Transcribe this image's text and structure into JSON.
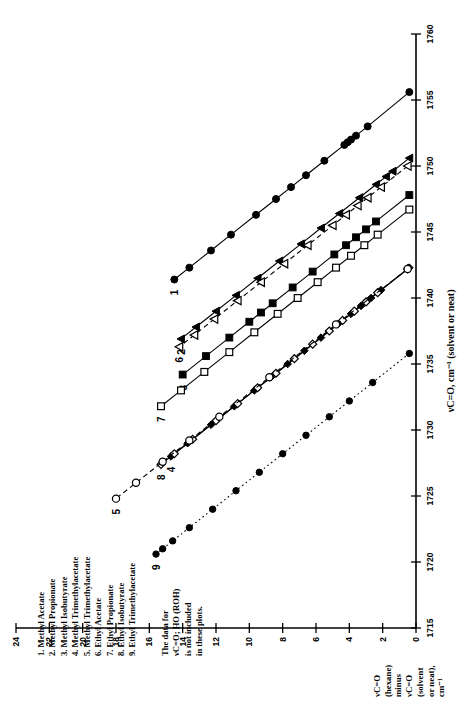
{
  "figure": {
    "legend_items": [
      "1. Methyl Acetate",
      "2. Methyl Propionate",
      "3. Methyl Isobutyrate",
      "4. Methyl Trimethylacetate",
      "5. Methyl Trimethylacetate",
      "6. Ethyl Acetate",
      "7. Ethyl Propionate",
      "8. Ethyl Isobutyrate",
      "9. Ethyl Trimethylacetate"
    ],
    "note_lines": [
      "The data for",
      "νC=O; HO (ROH)",
      "is not included",
      "in these plots."
    ],
    "ylabel_lines": [
      "νC=O",
      "(hexane)",
      "minus",
      "νC=O",
      "(solvent",
      "or neat),",
      "cm⁻¹"
    ],
    "xlabel": "νC=O, cm⁻¹ (solvent or neat)"
  },
  "chart_data": {
    "type": "scatter",
    "title": "",
    "xlabel": "νC=O, cm⁻¹ (solvent or neat)",
    "ylabel": "νC=O (hexane) minus νC=O (solvent or neat), cm⁻¹",
    "xlim": [
      1715,
      1760
    ],
    "ylim": [
      0,
      24
    ],
    "xticks": [
      1715,
      1720,
      1725,
      1730,
      1735,
      1740,
      1745,
      1750,
      1755,
      1760
    ],
    "yticks": [
      0,
      2,
      4,
      6,
      8,
      10,
      12,
      14,
      16,
      18,
      20,
      22,
      24
    ],
    "grid": false,
    "legend_position": "upper-left",
    "series": [
      {
        "name": "1. Methyl Acetate",
        "label": "1",
        "marker": "filled-circle",
        "line": "solid",
        "points": [
          [
            1755.6,
            0.4
          ],
          [
            1753.0,
            2.9
          ],
          [
            1752.3,
            3.6
          ],
          [
            1752.0,
            3.9
          ],
          [
            1751.8,
            4.1
          ],
          [
            1751.6,
            4.3
          ],
          [
            1750.4,
            5.5
          ],
          [
            1749.3,
            6.6
          ],
          [
            1748.4,
            7.5
          ],
          [
            1747.5,
            8.4
          ],
          [
            1746.3,
            9.6
          ],
          [
            1744.8,
            11.1
          ],
          [
            1743.6,
            12.3
          ],
          [
            1742.3,
            13.6
          ],
          [
            1741.4,
            14.5
          ]
        ]
      },
      {
        "name": "2. Methyl Propionate",
        "label": "2",
        "marker": "filled-triangle",
        "line": "solid",
        "points": [
          [
            1750.6,
            0.4
          ],
          [
            1749.6,
            1.4
          ],
          [
            1749.2,
            1.8
          ],
          [
            1748.6,
            2.4
          ],
          [
            1747.6,
            3.4
          ],
          [
            1746.4,
            4.6
          ],
          [
            1745.3,
            5.7
          ],
          [
            1744.1,
            6.9
          ],
          [
            1742.8,
            8.2
          ],
          [
            1741.5,
            9.5
          ],
          [
            1740.2,
            10.8
          ],
          [
            1739.0,
            12.0
          ],
          [
            1737.8,
            13.2
          ],
          [
            1736.9,
            14.1
          ]
        ]
      },
      {
        "name": "6. Ethyl Acetate",
        "label": "6",
        "marker": "open-triangle",
        "line": "dashed",
        "points": [
          [
            1750.0,
            0.5
          ],
          [
            1748.4,
            2.1
          ],
          [
            1747.6,
            2.9
          ],
          [
            1747.0,
            3.5
          ],
          [
            1746.3,
            4.2
          ],
          [
            1745.5,
            5.0
          ],
          [
            1744.0,
            6.5
          ],
          [
            1742.6,
            7.9
          ],
          [
            1741.2,
            9.3
          ],
          [
            1739.8,
            10.7
          ],
          [
            1738.4,
            12.1
          ],
          [
            1737.2,
            13.3
          ],
          [
            1736.3,
            14.2
          ]
        ]
      },
      {
        "name": "3. Methyl Isobutyrate",
        "label": "3",
        "marker": "filled-square",
        "line": "solid",
        "points": [
          [
            1747.8,
            0.4
          ],
          [
            1745.8,
            2.4
          ],
          [
            1745.2,
            3.0
          ],
          [
            1744.6,
            3.6
          ],
          [
            1744.0,
            4.2
          ],
          [
            1743.3,
            4.9
          ],
          [
            1742.0,
            6.2
          ],
          [
            1740.8,
            7.4
          ],
          [
            1739.6,
            8.6
          ],
          [
            1738.9,
            9.3
          ],
          [
            1738.2,
            10.0
          ],
          [
            1737.0,
            11.2
          ],
          [
            1735.6,
            12.6
          ],
          [
            1734.2,
            14.0
          ]
        ]
      },
      {
        "name": "7. Ethyl Propionate",
        "label": "7",
        "marker": "open-square",
        "line": "solid",
        "points": [
          [
            1746.7,
            0.4
          ],
          [
            1744.8,
            2.3
          ],
          [
            1744.0,
            3.1
          ],
          [
            1743.2,
            3.9
          ],
          [
            1742.3,
            4.8
          ],
          [
            1741.2,
            5.9
          ],
          [
            1740.0,
            7.1
          ],
          [
            1738.8,
            8.3
          ],
          [
            1737.4,
            9.7
          ],
          [
            1735.9,
            11.2
          ],
          [
            1734.4,
            12.7
          ],
          [
            1733.0,
            14.1
          ],
          [
            1731.8,
            15.3
          ]
        ]
      },
      {
        "name": "4. Methyl Trimethylacetate",
        "label": "4",
        "marker": "filled-diamond",
        "line": "solid",
        "points": [
          [
            1742.3,
            0.4
          ],
          [
            1740.6,
            2.1
          ],
          [
            1740.0,
            2.7
          ],
          [
            1739.4,
            3.3
          ],
          [
            1738.8,
            3.9
          ],
          [
            1738.0,
            4.7
          ],
          [
            1737.0,
            5.7
          ],
          [
            1736.0,
            6.7
          ],
          [
            1735.0,
            7.7
          ],
          [
            1734.0,
            8.7
          ],
          [
            1733.0,
            9.7
          ],
          [
            1731.8,
            10.9
          ],
          [
            1730.4,
            12.3
          ],
          [
            1729.0,
            13.7
          ],
          [
            1728.0,
            14.7
          ]
        ]
      },
      {
        "name": "8. Ethyl Isobutyrate",
        "label": "8",
        "marker": "open-diamond",
        "line": "solid",
        "points": [
          [
            1742.2,
            0.5
          ],
          [
            1740.4,
            2.3
          ],
          [
            1739.7,
            3.0
          ],
          [
            1739.0,
            3.7
          ],
          [
            1738.3,
            4.4
          ],
          [
            1737.5,
            5.2
          ],
          [
            1736.5,
            6.2
          ],
          [
            1735.4,
            7.3
          ],
          [
            1734.3,
            8.4
          ],
          [
            1733.2,
            9.5
          ],
          [
            1732.0,
            10.7
          ],
          [
            1730.7,
            12.0
          ],
          [
            1729.3,
            13.4
          ],
          [
            1728.2,
            14.5
          ],
          [
            1727.4,
            15.3
          ]
        ]
      },
      {
        "name": "5. Methyl Trimethylacetate",
        "label": "5",
        "marker": "open-circle",
        "line": "dashed",
        "points": [
          [
            1742.2,
            0.5
          ],
          [
            1738.0,
            4.8
          ],
          [
            1734.0,
            8.8
          ],
          [
            1731.0,
            11.8
          ],
          [
            1729.2,
            13.6
          ],
          [
            1727.6,
            15.2
          ],
          [
            1726.0,
            16.8
          ],
          [
            1724.8,
            18.0
          ]
        ]
      },
      {
        "name": "9. Ethyl Trimethylacetate",
        "label": "9",
        "marker": "filled-circle-small",
        "line": "dotted",
        "points": [
          [
            1735.8,
            0.4
          ],
          [
            1733.6,
            2.6
          ],
          [
            1732.2,
            4.0
          ],
          [
            1731.0,
            5.2
          ],
          [
            1729.6,
            6.6
          ],
          [
            1728.2,
            8.0
          ],
          [
            1726.8,
            9.4
          ],
          [
            1725.4,
            10.8
          ],
          [
            1724.0,
            12.2
          ],
          [
            1722.6,
            13.6
          ],
          [
            1721.6,
            14.6
          ],
          [
            1721.0,
            15.2
          ],
          [
            1720.6,
            15.6
          ]
        ]
      }
    ]
  }
}
